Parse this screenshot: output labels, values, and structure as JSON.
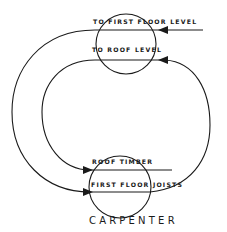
{
  "diagram": {
    "title": "CARPENTER",
    "labels": {
      "top_line": "TO FIRST FLOOR LEVEL",
      "second_line": "TO ROOF LEVEL",
      "third_line": "ROOF TIMBER",
      "bottom_line": "FIRST FLOOR JOISTS"
    },
    "colors": {
      "stroke": "#1a1a1a",
      "background": "#ffffff"
    }
  }
}
